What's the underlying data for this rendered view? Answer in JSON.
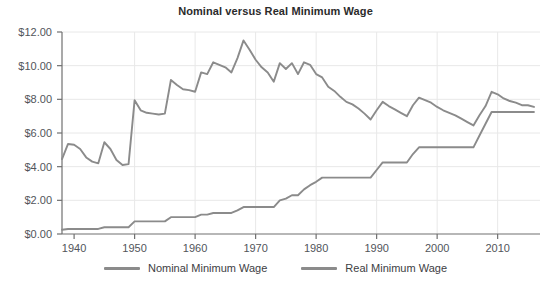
{
  "chart_data": {
    "type": "line",
    "title": "Nominal versus Real Minimum Wage",
    "xlabel": "",
    "ylabel": "",
    "xlim": [
      1938,
      2017
    ],
    "ylim": [
      0,
      12
    ],
    "grid": true,
    "legend_position": "bottom",
    "y_tick_labels": [
      "$12.00",
      "$10.00",
      "$8.00",
      "$6.00",
      "$4.00",
      "$2.00",
      "$0.00"
    ],
    "y_tick_values": [
      12,
      10,
      8,
      6,
      4,
      2,
      0
    ],
    "x_tick_labels": [
      "1940",
      "1950",
      "1960",
      "1970",
      "1980",
      "1990",
      "2000",
      "2010"
    ],
    "x_tick_values": [
      1940,
      1950,
      1960,
      1970,
      1980,
      1990,
      2000,
      2010
    ],
    "colors": {
      "nominal_line": "#8b8b8b",
      "real_line": "#8b8b8b",
      "grid": "#e8e8e8",
      "axis": "#707070",
      "title_text": "#2b2b2b",
      "tick_text": "#52555a"
    },
    "x": [
      1938,
      1939,
      1940,
      1941,
      1942,
      1943,
      1944,
      1945,
      1946,
      1947,
      1948,
      1949,
      1950,
      1951,
      1952,
      1953,
      1954,
      1955,
      1956,
      1957,
      1958,
      1959,
      1960,
      1961,
      1962,
      1963,
      1964,
      1965,
      1966,
      1967,
      1968,
      1969,
      1970,
      1971,
      1972,
      1973,
      1974,
      1975,
      1976,
      1977,
      1978,
      1979,
      1980,
      1981,
      1982,
      1983,
      1984,
      1985,
      1986,
      1987,
      1988,
      1989,
      1990,
      1991,
      1992,
      1993,
      1994,
      1995,
      1996,
      1997,
      1998,
      1999,
      2000,
      2001,
      2002,
      2003,
      2004,
      2005,
      2006,
      2007,
      2008,
      2009,
      2010,
      2011,
      2012,
      2013,
      2014,
      2015,
      2016
    ],
    "series": [
      {
        "name": "Nominal Minimum Wage",
        "values": [
          0.25,
          0.3,
          0.3,
          0.3,
          0.3,
          0.3,
          0.3,
          0.4,
          0.4,
          0.4,
          0.4,
          0.4,
          0.75,
          0.75,
          0.75,
          0.75,
          0.75,
          0.75,
          1.0,
          1.0,
          1.0,
          1.0,
          1.0,
          1.15,
          1.15,
          1.25,
          1.25,
          1.25,
          1.25,
          1.4,
          1.6,
          1.6,
          1.6,
          1.6,
          1.6,
          1.6,
          2.0,
          2.1,
          2.3,
          2.3,
          2.65,
          2.9,
          3.1,
          3.35,
          3.35,
          3.35,
          3.35,
          3.35,
          3.35,
          3.35,
          3.35,
          3.35,
          3.8,
          4.25,
          4.25,
          4.25,
          4.25,
          4.25,
          4.75,
          5.15,
          5.15,
          5.15,
          5.15,
          5.15,
          5.15,
          5.15,
          5.15,
          5.15,
          5.15,
          5.85,
          6.55,
          7.25,
          7.25,
          7.25,
          7.25,
          7.25,
          7.25,
          7.25,
          7.25
        ]
      },
      {
        "name": "Real Minimum Wage",
        "values": [
          4.45,
          5.35,
          5.3,
          5.05,
          4.55,
          4.3,
          4.2,
          5.45,
          5.05,
          4.4,
          4.1,
          4.15,
          7.95,
          7.35,
          7.2,
          7.15,
          7.1,
          7.15,
          9.15,
          8.85,
          8.6,
          8.55,
          8.45,
          9.6,
          9.5,
          10.2,
          10.05,
          9.9,
          9.6,
          10.45,
          11.5,
          10.95,
          10.35,
          9.9,
          9.6,
          9.05,
          10.15,
          9.8,
          10.15,
          9.5,
          10.2,
          10.05,
          9.5,
          9.3,
          8.75,
          8.5,
          8.15,
          7.85,
          7.7,
          7.45,
          7.15,
          6.8,
          7.35,
          7.85,
          7.6,
          7.4,
          7.2,
          7.0,
          7.65,
          8.1,
          7.95,
          7.8,
          7.55,
          7.35,
          7.2,
          7.05,
          6.85,
          6.65,
          6.45,
          7.05,
          7.6,
          8.45,
          8.3,
          8.05,
          7.9,
          7.8,
          7.65,
          7.65,
          7.55
        ]
      }
    ]
  },
  "legend": {
    "items": [
      {
        "label": "Nominal Minimum Wage",
        "color": "#8b8b8b"
      },
      {
        "label": "Real Minimum Wage",
        "color": "#8b8b8b"
      }
    ]
  }
}
